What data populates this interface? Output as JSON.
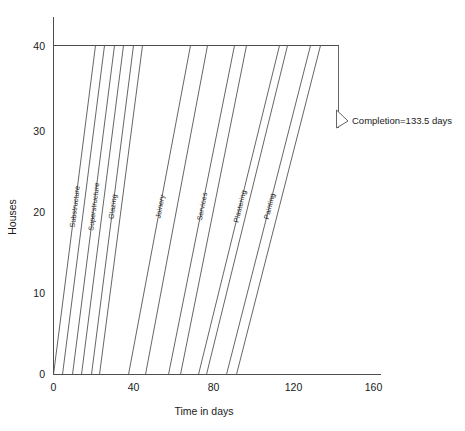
{
  "chart_data": {
    "type": "line",
    "title": "",
    "subtitle": "",
    "xlabel": "Time in days",
    "ylabel": "Houses",
    "xlim": [
      0,
      160
    ],
    "ylim": [
      0,
      40
    ],
    "xticks": [
      0,
      40,
      80,
      120,
      160
    ],
    "yticks": [
      0,
      10,
      20,
      30,
      40
    ],
    "grid": false,
    "legend": "none",
    "legend_position": "inline-rotated-labels",
    "series": [
      {
        "name": "Substructure",
        "label": "Substructure",
        "start_line": {
          "x_at_0_houses": 0.0,
          "x_at_40_houses": 21.0
        },
        "finish_line": {
          "x_at_0_houses": 4.5,
          "x_at_40_houses": 25.5
        }
      },
      {
        "name": "Superstructure",
        "label": "Superstructure",
        "start_line": {
          "x_at_0_houses": 9.5,
          "x_at_40_houses": 30.5
        },
        "finish_line": {
          "x_at_0_houses": 14.0,
          "x_at_40_houses": 35.0
        }
      },
      {
        "name": "Glazing",
        "label": "Glazing",
        "start_line": {
          "x_at_0_houses": 19.0,
          "x_at_40_houses": 40.0
        },
        "finish_line": {
          "x_at_0_houses": 23.0,
          "x_at_40_houses": 44.5
        }
      },
      {
        "name": "Joinery",
        "label": "Joinery",
        "start_line": {
          "x_at_0_houses": 37.5,
          "x_at_40_houses": 68.5
        },
        "finish_line": {
          "x_at_0_houses": 46.0,
          "x_at_40_houses": 77.0
        }
      },
      {
        "name": "Services",
        "label": "Services",
        "start_line": {
          "x_at_0_houses": 57.5,
          "x_at_40_houses": 90.5
        },
        "finish_line": {
          "x_at_0_houses": 63.5,
          "x_at_40_houses": 96.5
        }
      },
      {
        "name": "Plastering",
        "label": "Plastering",
        "start_line": {
          "x_at_0_houses": 72.5,
          "x_at_40_houses": 113.0
        },
        "finish_line": {
          "x_at_0_houses": 76.5,
          "x_at_40_houses": 117.0
        }
      },
      {
        "name": "Painting",
        "label": "Painting",
        "start_line": {
          "x_at_0_houses": 86.5,
          "x_at_40_houses": 128.5
        },
        "finish_line": {
          "x_at_0_houses": 91.5,
          "x_at_40_houses": 133.5
        }
      }
    ],
    "annotations": [
      {
        "name": "completion-marker",
        "text": "Completion=133.5 days",
        "value": 133.5,
        "units": "days",
        "x": 133.5,
        "y": 33.0,
        "marker": "triangle-right"
      }
    ]
  },
  "axes": {
    "x": {
      "label": "Time in days",
      "tick_labels": [
        "0",
        "40",
        "80",
        "120",
        "160"
      ]
    },
    "y": {
      "label": "Houses",
      "tick_labels": [
        "0",
        "10",
        "20",
        "30",
        "40"
      ]
    }
  },
  "colors": {
    "line": "#555555",
    "axis": "#4d4d4d",
    "text": "#1a1a1a",
    "background": "#ffffff"
  }
}
